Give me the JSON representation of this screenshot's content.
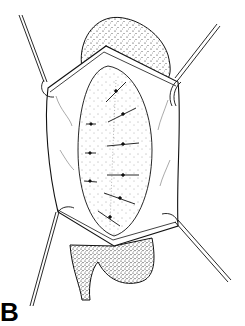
{
  "figure": {
    "panel_label": "B",
    "colors": {
      "ink": "#111111",
      "background": "#ffffff"
    }
  }
}
